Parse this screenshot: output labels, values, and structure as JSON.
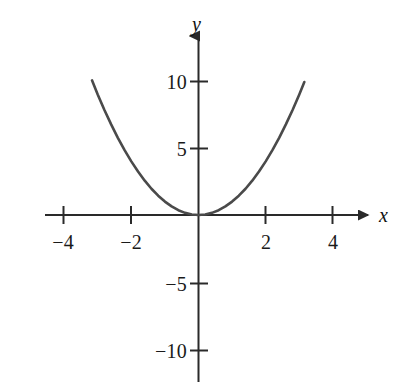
{
  "figure": {
    "background_color": "#ffffff",
    "axis_color": "#2a2a2a",
    "curve_color": "#4a4a4a",
    "label_color": "#1a1a1a"
  },
  "axis_labels": {
    "x": "x",
    "y": "y"
  },
  "x_tick_labels": [
    "−4",
    "−2",
    "2",
    "4"
  ],
  "y_tick_labels": [
    "10",
    "5",
    "−5",
    "−10"
  ],
  "chart_data": {
    "type": "line",
    "title": "",
    "subtitle": "",
    "xlabel": "x",
    "ylabel": "y",
    "equation": "y = x^2",
    "grid": false,
    "legend": null,
    "xlim": [
      -4.6,
      5.2
    ],
    "ylim": [
      -12.5,
      12.5
    ],
    "xticks": [
      -4,
      -2,
      2,
      4
    ],
    "xticklabels": [
      "−4",
      "−2",
      "2",
      "4"
    ],
    "yticks": [
      10,
      5,
      -5,
      -10
    ],
    "yticklabels": [
      "10",
      "5",
      "−5",
      "−10"
    ],
    "axis_arrows": {
      "x_positive": true,
      "y_positive": true
    },
    "series": [
      {
        "name": "y = x^2",
        "color": "#4a4a4a",
        "x": [
          -3.17,
          -3.0,
          -2.8,
          -2.6,
          -2.4,
          -2.2,
          -2.0,
          -1.8,
          -1.6,
          -1.4,
          -1.2,
          -1.0,
          -0.8,
          -0.6,
          -0.4,
          -0.2,
          0.0,
          0.2,
          0.4,
          0.6,
          0.8,
          1.0,
          1.2,
          1.4,
          1.6,
          1.8,
          2.0,
          2.2,
          2.4,
          2.6,
          2.8,
          3.0,
          3.15
        ],
        "values": [
          10.05,
          9.0,
          7.84,
          6.76,
          5.76,
          4.84,
          4.0,
          3.24,
          2.56,
          1.96,
          1.44,
          1.0,
          0.64,
          0.36,
          0.16,
          0.04,
          0.0,
          0.04,
          0.16,
          0.36,
          0.64,
          1.0,
          1.44,
          1.96,
          2.56,
          3.24,
          4.0,
          4.84,
          5.76,
          6.76,
          7.84,
          9.0,
          9.92
        ]
      }
    ]
  }
}
